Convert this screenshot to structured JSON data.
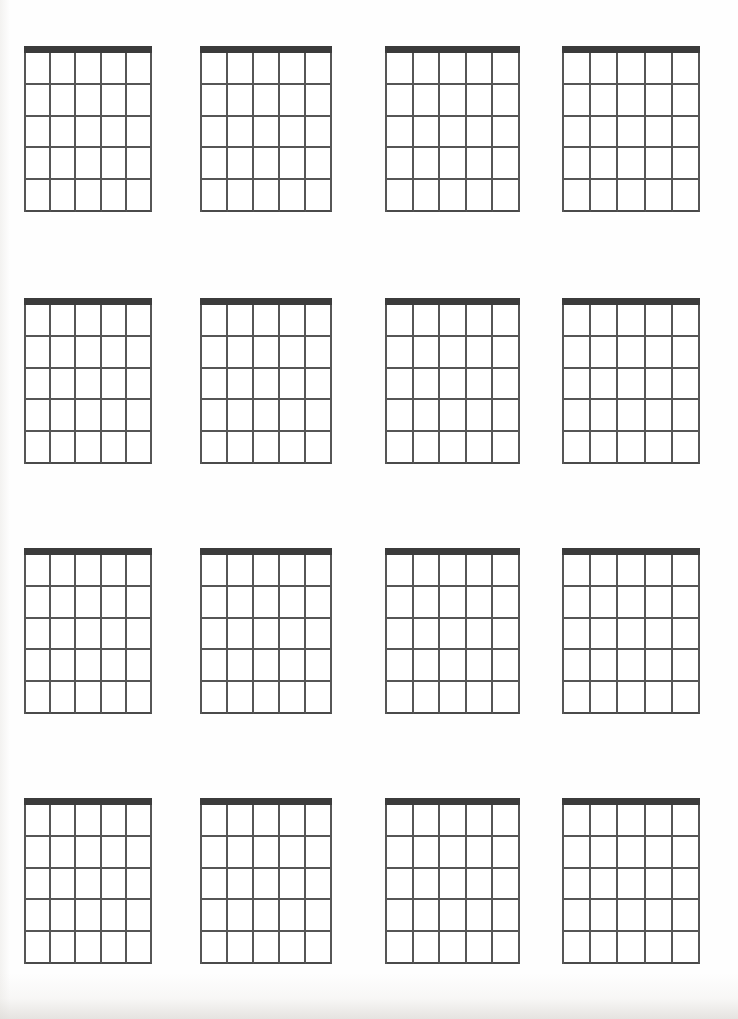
{
  "document": {
    "title": "Blank Guitar Chord Chart Sheet",
    "type": "chord-diagram-worksheet",
    "page_background_color": "#ffffff",
    "ink_color": "#565656",
    "nut_color": "#3b3b3b"
  },
  "layout": {
    "page_width": 738,
    "page_height": 1019,
    "rows": 4,
    "columns": 4,
    "total_diagrams": 16
  },
  "diagram_spec": {
    "strings": 6,
    "string_spaces": 5,
    "frets": 5,
    "has_nut": true,
    "nut_thickness": 7,
    "line_thickness": 2,
    "labels": [],
    "markers": []
  },
  "diagrams": [
    {
      "index": 1,
      "row": 1,
      "col": 1,
      "x": 24,
      "y": 46,
      "w": 128,
      "h": 166
    },
    {
      "index": 2,
      "row": 1,
      "col": 2,
      "x": 200,
      "y": 46,
      "w": 132,
      "h": 166
    },
    {
      "index": 3,
      "row": 1,
      "col": 3,
      "x": 385,
      "y": 46,
      "w": 135,
      "h": 166
    },
    {
      "index": 4,
      "row": 1,
      "col": 4,
      "x": 562,
      "y": 46,
      "w": 138,
      "h": 166
    },
    {
      "index": 5,
      "row": 2,
      "col": 1,
      "x": 24,
      "y": 298,
      "w": 128,
      "h": 166
    },
    {
      "index": 6,
      "row": 2,
      "col": 2,
      "x": 200,
      "y": 298,
      "w": 132,
      "h": 166
    },
    {
      "index": 7,
      "row": 2,
      "col": 3,
      "x": 385,
      "y": 298,
      "w": 135,
      "h": 166
    },
    {
      "index": 8,
      "row": 2,
      "col": 4,
      "x": 562,
      "y": 298,
      "w": 138,
      "h": 166
    },
    {
      "index": 9,
      "row": 3,
      "col": 1,
      "x": 24,
      "y": 548,
      "w": 128,
      "h": 166
    },
    {
      "index": 10,
      "row": 3,
      "col": 2,
      "x": 200,
      "y": 548,
      "w": 132,
      "h": 166
    },
    {
      "index": 11,
      "row": 3,
      "col": 3,
      "x": 385,
      "y": 548,
      "w": 135,
      "h": 166
    },
    {
      "index": 12,
      "row": 3,
      "col": 4,
      "x": 562,
      "y": 548,
      "w": 138,
      "h": 166
    },
    {
      "index": 13,
      "row": 4,
      "col": 1,
      "x": 24,
      "y": 798,
      "w": 128,
      "h": 166
    },
    {
      "index": 14,
      "row": 4,
      "col": 2,
      "x": 200,
      "y": 798,
      "w": 132,
      "h": 166
    },
    {
      "index": 15,
      "row": 4,
      "col": 3,
      "x": 385,
      "y": 798,
      "w": 135,
      "h": 166
    },
    {
      "index": 16,
      "row": 4,
      "col": 4,
      "x": 562,
      "y": 798,
      "w": 138,
      "h": 166
    }
  ]
}
